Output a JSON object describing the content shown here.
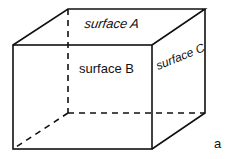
{
  "diagram": {
    "type": "cuboid",
    "surfaces": {
      "top": "surface A",
      "front": "surface B",
      "side": "surface C"
    },
    "figure_label": "a",
    "colors": {
      "stroke": "#111111",
      "background": "#ffffff"
    }
  }
}
